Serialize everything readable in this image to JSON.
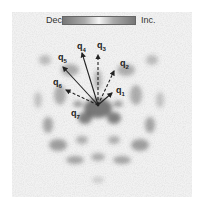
{
  "colorbar": {
    "left_label": "Dec.",
    "right_label": "Inc.",
    "colors": [
      "#777777",
      "#f4f4f4",
      "#777777"
    ]
  },
  "vectors": [
    {
      "name": "q",
      "sub": "1",
      "style": "solid",
      "label_x": 116,
      "label_y": 86,
      "end_x": 112,
      "end_y": 93
    },
    {
      "name": "q",
      "sub": "2",
      "style": "dashed",
      "label_x": 120,
      "label_y": 59,
      "end_x": 114,
      "end_y": 71
    },
    {
      "name": "q",
      "sub": "3",
      "style": "dashed",
      "label_x": 97,
      "label_y": 41,
      "end_x": 98,
      "end_y": 55
    },
    {
      "name": "q",
      "sub": "4",
      "style": "solid",
      "label_x": 77,
      "label_y": 42,
      "end_x": 82,
      "end_y": 53
    },
    {
      "name": "q",
      "sub": "5",
      "style": "solid",
      "label_x": 58,
      "label_y": 53,
      "end_x": 63,
      "end_y": 67
    },
    {
      "name": "q",
      "sub": "6",
      "style": "dashed",
      "label_x": 53,
      "label_y": 78,
      "end_x": 66,
      "end_y": 90
    },
    {
      "name": "q",
      "sub": "7",
      "style": "none",
      "label_x": 71,
      "label_y": 109,
      "end_x": 0,
      "end_y": 0
    }
  ],
  "origin": {
    "x": 98,
    "y": 105
  }
}
